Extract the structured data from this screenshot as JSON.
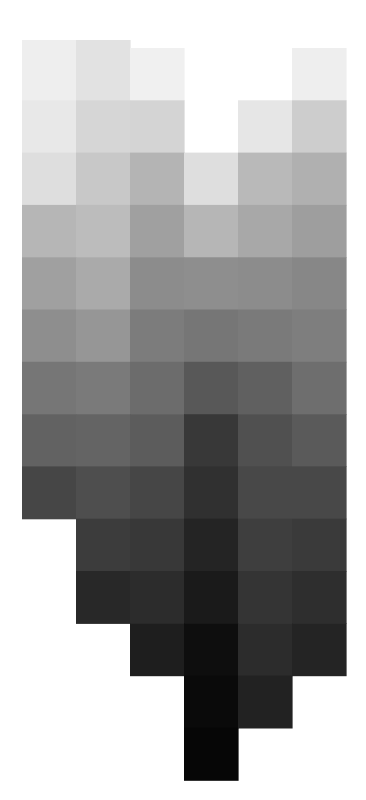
{
  "chart_data": {
    "type": "heatmap",
    "title": "",
    "xlabel": "",
    "ylabel": "",
    "colormap": "grayscale",
    "value_range": [
      0,
      255
    ],
    "columns": 6,
    "rows": 14,
    "series": [
      {
        "name": "column-1",
        "start_row": 0,
        "values": [
          238,
          232,
          222,
          182,
          160,
          142,
          118,
          98,
          70
        ]
      },
      {
        "name": "column-2",
        "start_row": 0,
        "values": [
          226,
          214,
          200,
          188,
          170,
          150,
          122,
          100,
          78,
          60,
          40
        ]
      },
      {
        "name": "column-3",
        "start_row": 0,
        "values": [
          240,
          212,
          180,
          160,
          140,
          124,
          108,
          92,
          70,
          56,
          44,
          30
        ]
      },
      {
        "name": "column-4",
        "start_row": 2,
        "values": [
          222,
          182,
          142,
          118,
          88,
          56,
          48,
          36,
          26,
          14,
          10,
          6
        ]
      },
      {
        "name": "column-5",
        "start_row": 1,
        "values": [
          230,
          185,
          168,
          140,
          122,
          96,
          80,
          72,
          62,
          52,
          44,
          34
        ]
      },
      {
        "name": "column-6",
        "start_row": 0,
        "values": [
          238,
          205,
          176,
          158,
          135,
          126,
          110,
          90,
          72,
          58,
          46,
          36
        ]
      }
    ],
    "grid": false,
    "legend": "none"
  }
}
